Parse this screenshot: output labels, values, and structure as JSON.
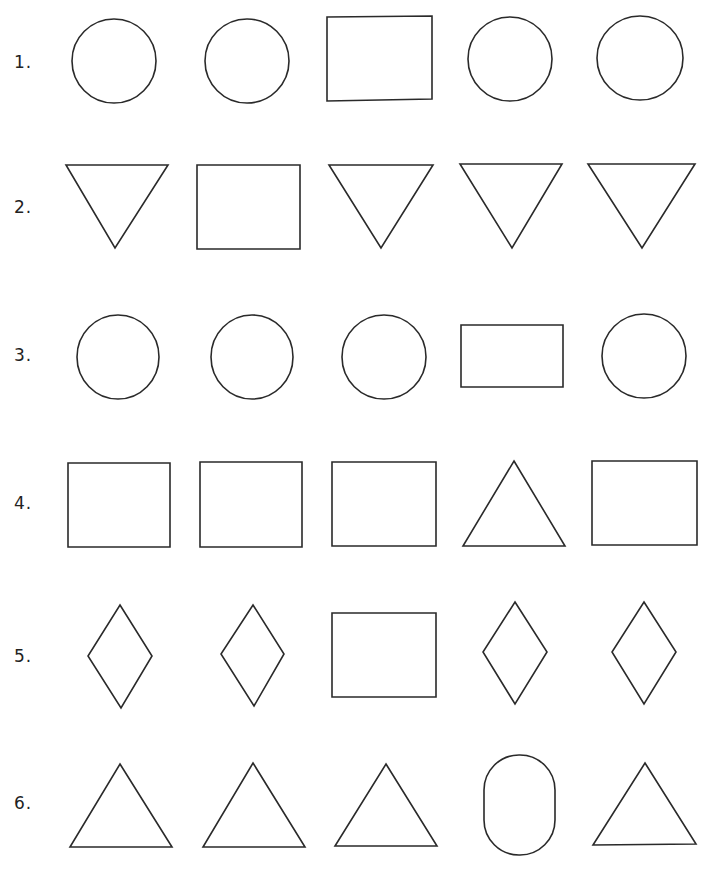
{
  "worksheet": {
    "instruction_hidden": "",
    "rows": [
      {
        "label": "1.",
        "shapes": [
          "circle",
          "circle",
          "rectangle",
          "circle",
          "circle"
        ],
        "odd_one_index": 2
      },
      {
        "label": "2.",
        "shapes": [
          "triangle-down",
          "rectangle",
          "triangle-down",
          "triangle-down",
          "triangle-down"
        ],
        "odd_one_index": 1
      },
      {
        "label": "3.",
        "shapes": [
          "ellipse",
          "ellipse",
          "ellipse",
          "rectangle",
          "ellipse"
        ],
        "odd_one_index": 3
      },
      {
        "label": "4.",
        "shapes": [
          "square",
          "square",
          "square",
          "triangle-up",
          "square"
        ],
        "odd_one_index": 3
      },
      {
        "label": "5.",
        "shapes": [
          "diamond",
          "diamond",
          "square",
          "diamond",
          "diamond"
        ],
        "odd_one_index": 2
      },
      {
        "label": "6.",
        "shapes": [
          "triangle-up",
          "triangle-up",
          "triangle-up",
          "stadium",
          "triangle-up"
        ],
        "odd_one_index": 3
      }
    ],
    "colors": {
      "stroke": "#2a2a2a",
      "background": "#ffffff"
    }
  }
}
